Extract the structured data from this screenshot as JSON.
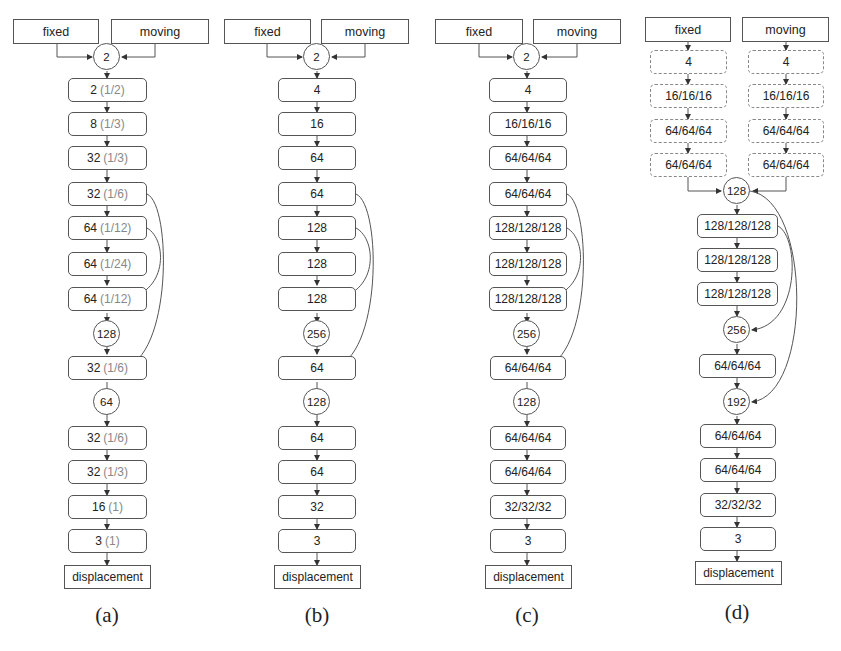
{
  "figure": {
    "panels": [
      {
        "id": "a",
        "caption": "(a)",
        "inputs": [
          "fixed",
          "moving"
        ],
        "merge": "2",
        "layers": [
          {
            "value": "2",
            "frac": "(1/2)"
          },
          {
            "value": "8",
            "frac": "(1/3)"
          },
          {
            "value": "32",
            "frac": "(1/3)"
          },
          {
            "value": "32",
            "frac": "(1/6)"
          },
          {
            "value": "64",
            "frac": "(1/12)"
          },
          {
            "value": "64",
            "frac": "(1/24)"
          },
          {
            "value": "64",
            "frac": "(1/12)"
          },
          {
            "value": "128",
            "type": "concat"
          },
          {
            "value": "32",
            "frac": "(1/6)"
          },
          {
            "value": "64",
            "type": "concat"
          },
          {
            "value": "32",
            "frac": "(1/6)"
          },
          {
            "value": "32",
            "frac": "(1/3)"
          },
          {
            "value": "16",
            "frac": "(1)"
          },
          {
            "value": "3",
            "frac": "(1)"
          }
        ],
        "output": "displacement"
      },
      {
        "id": "b",
        "caption": "(b)",
        "inputs": [
          "fixed",
          "moving"
        ],
        "merge": "2",
        "layers": [
          {
            "value": "4"
          },
          {
            "value": "16"
          },
          {
            "value": "64"
          },
          {
            "value": "64"
          },
          {
            "value": "128"
          },
          {
            "value": "128"
          },
          {
            "value": "128"
          },
          {
            "value": "256",
            "type": "concat"
          },
          {
            "value": "64"
          },
          {
            "value": "128",
            "type": "concat"
          },
          {
            "value": "64"
          },
          {
            "value": "64"
          },
          {
            "value": "32"
          },
          {
            "value": "3"
          }
        ],
        "output": "displacement"
      },
      {
        "id": "c",
        "caption": "(c)",
        "inputs": [
          "fixed",
          "moving"
        ],
        "merge": "2",
        "layers": [
          {
            "value": "4"
          },
          {
            "value": "16/16/16"
          },
          {
            "value": "64/64/64"
          },
          {
            "value": "64/64/64"
          },
          {
            "value": "128/128/128"
          },
          {
            "value": "128/128/128"
          },
          {
            "value": "128/128/128"
          },
          {
            "value": "256",
            "type": "concat"
          },
          {
            "value": "64/64/64"
          },
          {
            "value": "128",
            "type": "concat"
          },
          {
            "value": "64/64/64"
          },
          {
            "value": "64/64/64"
          },
          {
            "value": "32/32/32"
          },
          {
            "value": "3"
          }
        ],
        "output": "displacement"
      },
      {
        "id": "d",
        "caption": "(d)",
        "inputs": [
          "fixed",
          "moving"
        ],
        "branch_layers": [
          "4",
          "16/16/16",
          "64/64/64",
          "64/64/64"
        ],
        "merge": "128",
        "layers": [
          {
            "value": "128/128/128"
          },
          {
            "value": "128/128/128"
          },
          {
            "value": "128/128/128"
          },
          {
            "value": "256",
            "type": "concat"
          },
          {
            "value": "64/64/64"
          },
          {
            "value": "192",
            "type": "concat"
          },
          {
            "value": "64/64/64"
          },
          {
            "value": "64/64/64"
          },
          {
            "value": "32/32/32"
          },
          {
            "value": "3"
          }
        ],
        "output": "displacement"
      }
    ]
  },
  "labels": {
    "a": {
      "fixed": "fixed",
      "moving": "moving",
      "merge": "2",
      "l1v": "2",
      "l1f": "(1/2)",
      "l2v": "8",
      "l2f": "(1/3)",
      "l3v": "32",
      "l3f": "(1/3)",
      "l4v": "32",
      "l4f": "(1/6)",
      "l5v": "64",
      "l5f": "(1/12)",
      "l6v": "64",
      "l6f": "(1/24)",
      "l7v": "64",
      "l7f": "(1/12)",
      "c1": "128",
      "l8v": "32",
      "l8f": "(1/6)",
      "c2": "64",
      "l9v": "32",
      "l9f": "(1/6)",
      "l10v": "32",
      "l10f": "(1/3)",
      "l11v": "16",
      "l11f": "(1)",
      "l12v": "3",
      "l12f": "(1)",
      "out": "displacement",
      "caption": "(a)"
    },
    "b": {
      "fixed": "fixed",
      "moving": "moving",
      "merge": "2",
      "l1": "4",
      "l2": "16",
      "l3": "64",
      "l4": "64",
      "l5": "128",
      "l6": "128",
      "l7": "128",
      "c1": "256",
      "l8": "64",
      "c2": "128",
      "l9": "64",
      "l10": "64",
      "l11": "32",
      "l12": "3",
      "out": "displacement",
      "caption": "(b)"
    },
    "c": {
      "fixed": "fixed",
      "moving": "moving",
      "merge": "2",
      "l1": "4",
      "l2": "16/16/16",
      "l3": "64/64/64",
      "l4": "64/64/64",
      "l5": "128/128/128",
      "l6": "128/128/128",
      "l7": "128/128/128",
      "c1": "256",
      "l8": "64/64/64",
      "c2": "128",
      "l9": "64/64/64",
      "l10": "64/64/64",
      "l11": "32/32/32",
      "l12": "3",
      "out": "displacement",
      "caption": "(c)"
    },
    "d": {
      "fixed": "fixed",
      "moving": "moving",
      "f1": "4",
      "f2": "16/16/16",
      "f3": "64/64/64",
      "f4": "64/64/64",
      "m1": "4",
      "m2": "16/16/16",
      "m3": "64/64/64",
      "m4": "64/64/64",
      "merge": "128",
      "l1": "128/128/128",
      "l2": "128/128/128",
      "l3": "128/128/128",
      "c1": "256",
      "l4": "64/64/64",
      "c2": "192",
      "l5": "64/64/64",
      "l6": "64/64/64",
      "l7": "32/32/32",
      "l8": "3",
      "out": "displacement",
      "caption": "(d)"
    }
  },
  "colors": {
    "stroke": "#555555",
    "text": "#222222",
    "fraction_text": "#888888",
    "background": "#ffffff"
  }
}
